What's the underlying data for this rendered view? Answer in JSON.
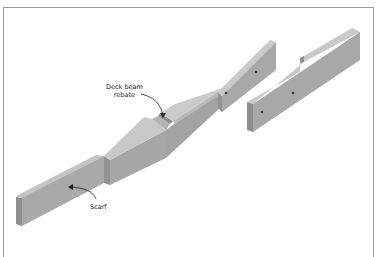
{
  "figure": {
    "labels": {
      "deck_beam_rebate": {
        "line1": "Deck beam",
        "line2": "rebate"
      },
      "scarf": "Scarf"
    },
    "colors": {
      "frame": "#9a9a9a",
      "top_face": "#c9c9c9",
      "side_face": "#a9a9a9",
      "end_face": "#8e8e8e",
      "arrow": "#222222"
    }
  }
}
